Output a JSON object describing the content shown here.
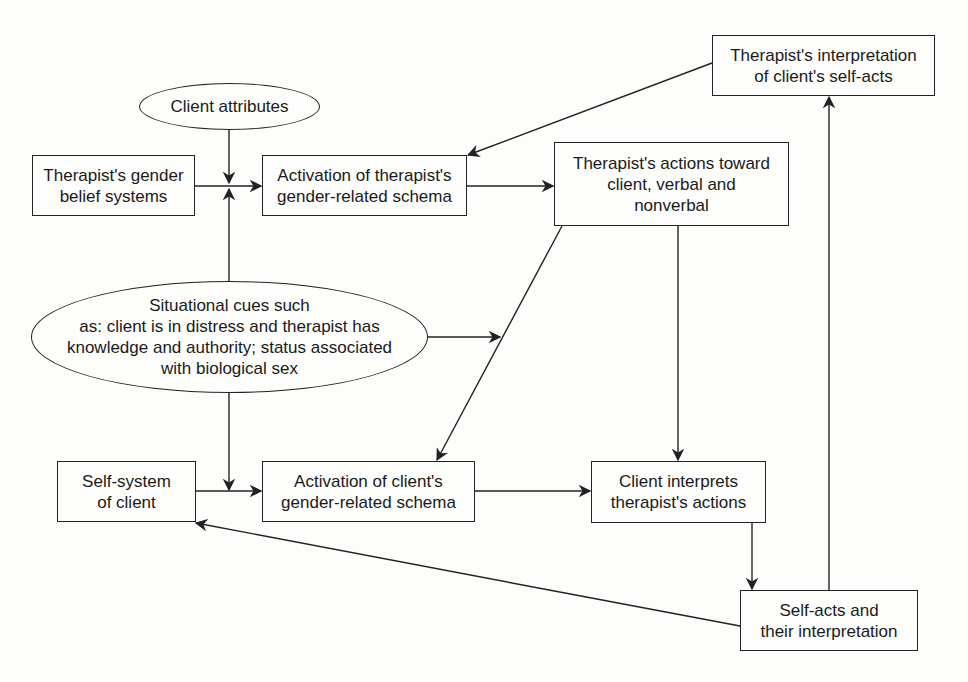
{
  "nodes": {
    "client_attributes": "Client attributes",
    "therapist_gender_beliefs": "Therapist's gender\nbelief systems",
    "activation_therapist_schema": "Activation of therapist's\ngender-related schema",
    "therapist_interpretation": "Therapist's interpretation\nof client's self-acts",
    "therapist_actions": "Therapist's actions toward\nclient, verbal and\nnonverbal",
    "situational_cues": "Situational cues such\nas: client is in distress and therapist has\nknowledge and authority; status associated\nwith biological sex",
    "self_system": "Self-system\nof client",
    "activation_client_schema": "Activation of client's\ngender-related schema",
    "client_interprets": "Client interprets\ntherapist's actions",
    "self_acts": "Self-acts and\ntheir interpretation"
  },
  "edges": [
    {
      "from": "client_attributes",
      "to": "activation_therapist_schema"
    },
    {
      "from": "therapist_gender_beliefs",
      "to": "activation_therapist_schema"
    },
    {
      "from": "situational_cues",
      "to": "activation_therapist_schema"
    },
    {
      "from": "activation_therapist_schema",
      "to": "therapist_actions"
    },
    {
      "from": "therapist_interpretation",
      "to": "activation_therapist_schema"
    },
    {
      "from": "situational_cues",
      "to": "therapist_actions"
    },
    {
      "from": "therapist_actions",
      "to": "activation_client_schema"
    },
    {
      "from": "therapist_actions",
      "to": "client_interprets"
    },
    {
      "from": "situational_cues",
      "to": "activation_client_schema"
    },
    {
      "from": "self_system",
      "to": "activation_client_schema"
    },
    {
      "from": "activation_client_schema",
      "to": "client_interprets"
    },
    {
      "from": "client_interprets",
      "to": "self_acts"
    },
    {
      "from": "self_acts",
      "to": "therapist_interpretation"
    },
    {
      "from": "self_acts",
      "to": "self_system"
    }
  ]
}
